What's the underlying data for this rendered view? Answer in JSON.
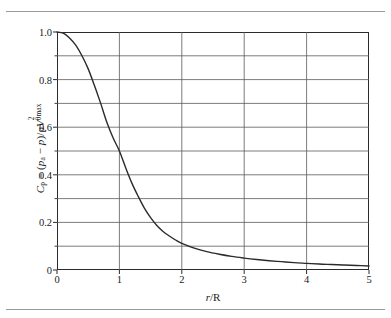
{
  "figure": {
    "background_color": "#ffffff",
    "frame_color": "#2b2b2b",
    "grid_color": "#5a5a5a",
    "curve_color": "#2b2b2b"
  },
  "axes": {
    "x": {
      "label_plain": "r/R",
      "label_parts": {
        "numerator": "r",
        "slash": "/",
        "denominator": "R"
      },
      "ticks": [
        "0",
        "1",
        "2",
        "3",
        "4",
        "5"
      ],
      "tick_values": [
        0,
        1,
        2,
        3,
        4,
        5
      ],
      "min": 0,
      "max": 5
    },
    "y": {
      "label_plain": "Cp = (pa − p)/ρV²θmax",
      "label_parts": {
        "symbol": "C",
        "symbol_sub": "p",
        "equals": " = (",
        "p_a": "p",
        "p_a_sub": "a",
        "minus": " − ",
        "p": "p",
        "close_div": ")/ρ",
        "V": "V",
        "V_sup": "2",
        "V_sub": "θmax"
      },
      "ticks": [
        "0",
        "0.2",
        "0.4",
        "0.6",
        "0.8",
        "1.0"
      ],
      "tick_values": [
        0,
        0.2,
        0.4,
        0.6,
        0.8,
        1.0
      ],
      "min": 0,
      "max": 1.0
    }
  },
  "chart_data": {
    "type": "line",
    "title": "",
    "xlabel": "r/R",
    "ylabel": "C_p = (p_a − p)/ρV²_θmax",
    "xlim": [
      0,
      5
    ],
    "ylim": [
      0,
      1.0
    ],
    "grid": true,
    "grid_x_step": 1.0,
    "grid_y_step": 0.1,
    "legend": null,
    "series": [
      {
        "name": "Cp vs r/R",
        "color": "#2b2b2b",
        "x": [
          0.0,
          0.1,
          0.2,
          0.3,
          0.4,
          0.5,
          0.6,
          0.7,
          0.8,
          0.9,
          1.0,
          1.1,
          1.2,
          1.3,
          1.4,
          1.5,
          1.6,
          1.7,
          1.8,
          1.9,
          2.0,
          2.2,
          2.4,
          2.6,
          2.8,
          3.0,
          3.2,
          3.4,
          3.6,
          3.8,
          4.0,
          4.2,
          4.4,
          4.6,
          4.8,
          5.0
        ],
        "y": [
          1.0,
          0.995,
          0.975,
          0.945,
          0.9,
          0.845,
          0.775,
          0.7,
          0.62,
          0.555,
          0.5,
          0.43,
          0.365,
          0.31,
          0.26,
          0.22,
          0.187,
          0.162,
          0.143,
          0.126,
          0.112,
          0.092,
          0.077,
          0.066,
          0.057,
          0.05,
          0.044,
          0.039,
          0.035,
          0.031,
          0.028,
          0.025,
          0.023,
          0.021,
          0.019,
          0.017
        ]
      }
    ],
    "annotations": []
  }
}
